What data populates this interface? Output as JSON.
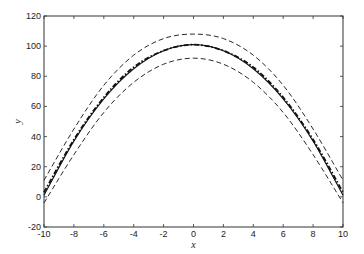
{
  "chart_data": {
    "type": "line",
    "title": "",
    "xlabel": "x",
    "ylabel": "y",
    "xlim": [
      -10,
      10
    ],
    "ylim": [
      -20,
      120
    ],
    "xticks": [
      -10,
      -8,
      -6,
      -4,
      -2,
      0,
      2,
      4,
      6,
      8,
      10
    ],
    "yticks": [
      -20,
      0,
      20,
      40,
      60,
      80,
      100,
      120
    ],
    "grid": false,
    "legend": null,
    "x": [
      -10,
      -8,
      -6,
      -4,
      -2,
      0,
      2,
      4,
      6,
      8,
      10
    ],
    "series": [
      {
        "name": "true curve",
        "style": "solid",
        "values": [
          1,
          37,
          65,
          85,
          97,
          101,
          97,
          85,
          65,
          37,
          1
        ]
      },
      {
        "name": "estimate",
        "style": "dashdot",
        "values": [
          3,
          38,
          66,
          86,
          97,
          101,
          97,
          86,
          66,
          38,
          3
        ]
      },
      {
        "name": "upper bound",
        "style": "dashed",
        "values": [
          11,
          45,
          74,
          94,
          105,
          108,
          105,
          94,
          74,
          45,
          11
        ]
      },
      {
        "name": "lower bound",
        "style": "dashed",
        "values": [
          -4,
          28,
          56,
          76,
          88,
          92,
          88,
          76,
          56,
          28,
          -4
        ]
      }
    ]
  }
}
